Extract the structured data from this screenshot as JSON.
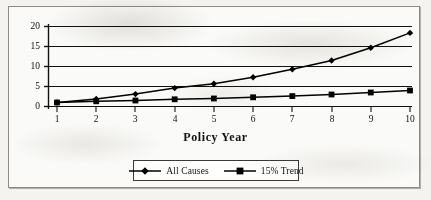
{
  "chart_data": {
    "type": "line",
    "title": "",
    "xlabel": "Policy Year",
    "ylabel": "",
    "categories": [
      1,
      2,
      3,
      4,
      5,
      6,
      7,
      8,
      9,
      10
    ],
    "x": [
      1,
      2,
      3,
      4,
      5,
      6,
      7,
      8,
      9,
      10
    ],
    "series": [
      {
        "name": "All Causes",
        "marker": "diamond",
        "color": "#000000",
        "values": [
          1.0,
          1.9,
          3.1,
          4.6,
          5.7,
          7.3,
          9.3,
          11.5,
          14.7,
          18.4
        ]
      },
      {
        "name": "15% Trend",
        "marker": "square",
        "color": "#000000",
        "values": [
          1.0,
          1.3,
          1.5,
          1.8,
          2.0,
          2.3,
          2.6,
          3.0,
          3.5,
          4.0
        ]
      }
    ],
    "xlim": [
      0.55,
      10.45
    ],
    "ylim": [
      0,
      20.8
    ],
    "yticks": [
      0,
      5,
      10,
      15,
      20
    ],
    "ytick_labels": [
      "0",
      "5",
      "10",
      "15",
      "20"
    ],
    "xtick_labels": [
      "1",
      "2",
      "3",
      "4",
      "5",
      "6",
      "7",
      "8",
      "9",
      "10"
    ],
    "grid": "horizontal",
    "legend_position": "bottom-center"
  },
  "legend": {
    "entries": [
      {
        "label": "All Causes",
        "marker": "diamond-marker"
      },
      {
        "label": "15% Trend",
        "marker": "square-marker"
      }
    ]
  },
  "axis": {
    "x_title": "Policy Year"
  }
}
